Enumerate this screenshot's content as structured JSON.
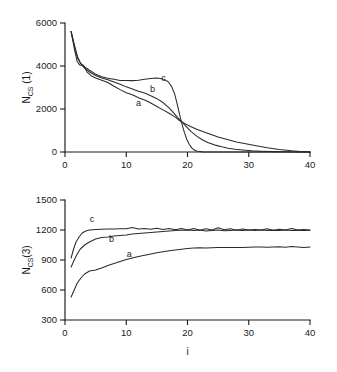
{
  "figure": {
    "background": "#ffffff",
    "ink_color": "#1a1a1a"
  },
  "chart_data": [
    {
      "id": "top",
      "type": "line",
      "title": "",
      "xlabel": "",
      "ylabel": "N_CS (1)",
      "ylabel_parts": {
        "base": "N",
        "subscript": "CS",
        "suffix": " (1)"
      },
      "xlim": [
        0,
        40
      ],
      "ylim": [
        0,
        6000
      ],
      "xticks": [
        0,
        10,
        20,
        30,
        40
      ],
      "xticklabels": [
        "0",
        "10",
        "20",
        "30",
        "40"
      ],
      "yticks": [
        0,
        2000,
        4000,
        6000
      ],
      "yticklabels": [
        "0",
        "2000",
        "4000",
        "6000"
      ],
      "grid": false,
      "legend": "inline-curve-labels",
      "annotations": [
        {
          "text": "a",
          "x": 12.0,
          "y": 2150
        },
        {
          "text": "b",
          "x": 14.3,
          "y": 2800
        },
        {
          "text": "c",
          "x": 16.1,
          "y": 3320
        }
      ],
      "series": [
        {
          "name": "a",
          "x": [
            1,
            1.6,
            2,
            2.4,
            3,
            3.6,
            4.2,
            5,
            6,
            7,
            8,
            9,
            10,
            11,
            12,
            13,
            14,
            15,
            16,
            17,
            18,
            18.6,
            19.5,
            20.5,
            21.5,
            22.5,
            23.5,
            25,
            26.5,
            28,
            29.5,
            31,
            33,
            35,
            37,
            38.5,
            40
          ],
          "y": [
            5600,
            4700,
            4200,
            4050,
            4030,
            3720,
            3560,
            3440,
            3340,
            3230,
            3060,
            2900,
            2760,
            2660,
            2520,
            2420,
            2280,
            2120,
            1960,
            1800,
            1620,
            1480,
            1330,
            1190,
            1060,
            950,
            850,
            700,
            580,
            470,
            380,
            300,
            200,
            120,
            55,
            25,
            0
          ]
        },
        {
          "name": "b",
          "x": [
            1,
            1.6,
            2.1,
            2.7,
            3.3,
            4,
            5,
            6,
            7,
            8,
            9,
            10,
            11,
            12,
            13,
            14,
            15,
            16,
            17,
            17.8,
            18.4,
            19,
            19.8,
            20.6,
            21.5,
            22.4,
            23.4,
            24.5,
            25.6,
            26.6,
            27.8,
            29,
            30.5,
            32,
            34,
            36,
            38,
            40
          ],
          "y": [
            5600,
            4900,
            4350,
            4050,
            3880,
            3720,
            3560,
            3440,
            3360,
            3260,
            3150,
            3030,
            2930,
            2830,
            2740,
            2620,
            2480,
            2300,
            2050,
            1800,
            1600,
            1420,
            1180,
            950,
            740,
            570,
            430,
            320,
            240,
            175,
            125,
            90,
            55,
            35,
            18,
            8,
            2,
            0
          ]
        },
        {
          "name": "c",
          "x": [
            1,
            1.5,
            2,
            2.5,
            3.2,
            4,
            5,
            6,
            7,
            8,
            9,
            10,
            11,
            12,
            13,
            14,
            15,
            16,
            16.8,
            17.4,
            17.9,
            18.3,
            18.7,
            19.1,
            19.5,
            19.9,
            20.3,
            20.7,
            21.1,
            21.6,
            22.5,
            25,
            30,
            35,
            40
          ],
          "y": [
            5600,
            4950,
            4450,
            4150,
            3960,
            3800,
            3620,
            3500,
            3430,
            3380,
            3330,
            3330,
            3320,
            3340,
            3380,
            3420,
            3440,
            3400,
            3280,
            3050,
            2700,
            2250,
            1750,
            1300,
            900,
            580,
            350,
            190,
            90,
            30,
            5,
            0,
            0,
            0,
            0
          ]
        }
      ]
    },
    {
      "id": "bottom",
      "type": "line",
      "title": "",
      "xlabel": "i",
      "ylabel": "N_CS(3)",
      "ylabel_parts": {
        "base": "N",
        "subscript": "CS",
        "suffix": "(3)"
      },
      "xlim": [
        0,
        40
      ],
      "ylim": [
        300,
        1500
      ],
      "xticks": [
        0,
        10,
        20,
        30,
        40
      ],
      "xticklabels": [
        "0",
        "10",
        "20",
        "30",
        "40"
      ],
      "yticks": [
        300,
        600,
        900,
        1200,
        1500
      ],
      "yticklabels": [
        "300",
        "600",
        "900",
        "1200",
        "1500"
      ],
      "grid": false,
      "legend": "inline-curve-labels",
      "annotations": [
        {
          "text": "a",
          "x": 10.5,
          "y": 930
        },
        {
          "text": "b",
          "x": 7.6,
          "y": 1080
        },
        {
          "text": "c",
          "x": 4.4,
          "y": 1280
        }
      ],
      "series": [
        {
          "name": "a",
          "x": [
            1,
            1.5,
            2,
            2.6,
            3.2,
            4,
            5,
            6,
            7,
            8,
            9,
            10,
            11,
            12,
            13,
            14,
            15,
            16,
            17,
            18,
            19,
            20,
            21,
            22,
            23,
            24,
            25,
            26,
            27,
            28,
            29,
            30,
            31,
            32,
            33,
            34,
            35,
            36,
            37,
            38,
            39,
            40
          ],
          "y": [
            530,
            600,
            670,
            720,
            760,
            790,
            800,
            820,
            845,
            865,
            885,
            905,
            920,
            935,
            948,
            960,
            972,
            982,
            992,
            1000,
            1008,
            1014,
            1020,
            1022,
            1020,
            1022,
            1024,
            1026,
            1026,
            1024,
            1026,
            1028,
            1030,
            1030,
            1028,
            1030,
            1032,
            1028,
            1034,
            1030,
            1026,
            1030
          ]
        },
        {
          "name": "b",
          "x": [
            1,
            1.5,
            2,
            2.5,
            3.2,
            4,
            5,
            6,
            7,
            8,
            9,
            10,
            11,
            12,
            13,
            14,
            15,
            16,
            17,
            18,
            19,
            20,
            21,
            22,
            23,
            24,
            25,
            26,
            27,
            28,
            29,
            30,
            31,
            32,
            33,
            34,
            35,
            36,
            37,
            38,
            39,
            40
          ],
          "y": [
            830,
            900,
            960,
            1010,
            1050,
            1080,
            1110,
            1125,
            1130,
            1140,
            1145,
            1150,
            1160,
            1165,
            1170,
            1175,
            1180,
            1185,
            1190,
            1195,
            1198,
            1200,
            1196,
            1200,
            1190,
            1196,
            1200,
            1192,
            1196,
            1200,
            1195,
            1200,
            1196,
            1200,
            1194,
            1198,
            1196,
            1200,
            1195,
            1198,
            1194,
            1198
          ]
        },
        {
          "name": "c",
          "x": [
            1,
            1.4,
            1.8,
            2.3,
            2.8,
            3.4,
            4,
            5,
            6,
            7,
            8,
            9,
            10,
            11,
            12,
            13,
            14,
            15,
            16,
            17,
            18,
            19,
            20,
            21,
            22,
            23,
            24,
            25,
            26,
            27,
            28,
            29,
            30,
            31,
            32,
            33,
            34,
            35,
            36,
            37,
            38,
            39,
            40
          ],
          "y": [
            920,
            1010,
            1080,
            1130,
            1170,
            1190,
            1200,
            1205,
            1208,
            1210,
            1210,
            1212,
            1212,
            1225,
            1210,
            1215,
            1208,
            1218,
            1205,
            1215,
            1202,
            1216,
            1200,
            1214,
            1198,
            1212,
            1200,
            1222,
            1202,
            1212,
            1198,
            1210,
            1200,
            1206,
            1200,
            1212,
            1198,
            1208,
            1200,
            1214,
            1200,
            1206,
            1200
          ]
        }
      ]
    }
  ]
}
